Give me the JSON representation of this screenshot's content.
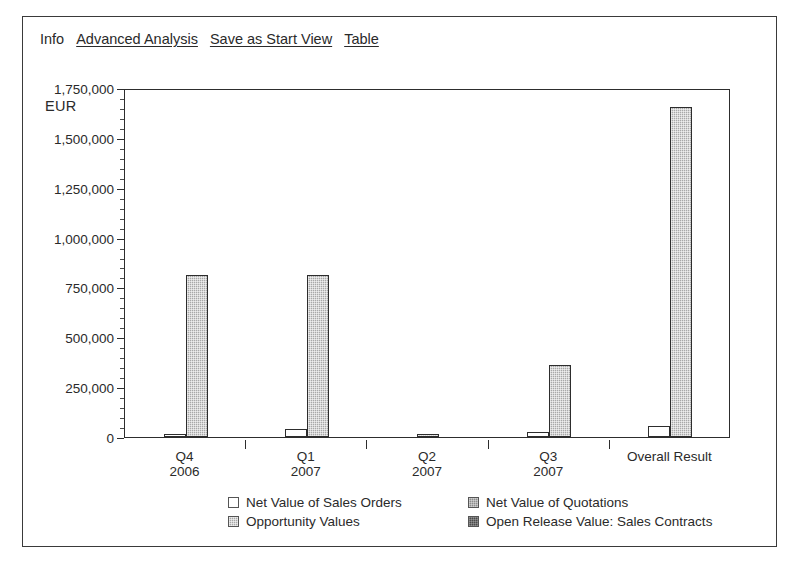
{
  "toolbar": {
    "items": [
      {
        "label": "Info",
        "link": false
      },
      {
        "label": "Advanced Analysis",
        "link": true
      },
      {
        "label": "Save as Start View",
        "link": true
      },
      {
        "label": "Table",
        "link": true
      }
    ]
  },
  "axis": {
    "unit_label": "EUR",
    "y_ticks": [
      "1,750,000",
      "1,500,000",
      "1,250,000",
      "1,000,000",
      "750,000",
      "500,000",
      "250,000",
      "0"
    ]
  },
  "colors": {
    "net_value_sales_orders": "#ffffff",
    "net_value_quotations": "#8d8d8d",
    "opportunity_values": "#a8a8a8",
    "open_release_value": "#4a4a4a",
    "axis": "#2d2d2d",
    "text": "#2a2a2a",
    "frame": "#3a3a3a"
  },
  "legend": {
    "entries": [
      {
        "label": "Net Value of Sales Orders",
        "swatch": "sw-white"
      },
      {
        "label": "Net Value of Quotations",
        "swatch": "sw-midgray"
      },
      {
        "label": "Opportunity Values",
        "swatch": "sw-lightgray"
      },
      {
        "label": "Open Release Value: Sales Contracts",
        "swatch": "sw-darkgray"
      }
    ]
  },
  "chart_data": {
    "type": "bar",
    "title": "",
    "subtitle": "",
    "xlabel": "",
    "ylabel": "EUR",
    "ylim": [
      0,
      1750000
    ],
    "ytick_step": 250000,
    "yticks": [
      0,
      250000,
      500000,
      750000,
      1000000,
      1250000,
      1500000,
      1750000
    ],
    "minor_ticks_per_interval": 5,
    "grid": false,
    "legend_position": "bottom",
    "categories": [
      "Q4\n2006",
      "Q1\n2007",
      "Q2\n2007",
      "Q3\n2007",
      "Overall Result"
    ],
    "category_lines": [
      [
        "Q4",
        "2006"
      ],
      [
        "Q1",
        "2007"
      ],
      [
        "Q2",
        "2007"
      ],
      [
        "Q3",
        "2007"
      ],
      [
        "Overall Result",
        ""
      ]
    ],
    "series": [
      {
        "name": "Net Value of Sales Orders",
        "color": "#ffffff",
        "style": "white",
        "values": [
          5000,
          40000,
          0,
          25000,
          55000
        ]
      },
      {
        "name": "Net Value of Quotations",
        "color": "#8d8d8d",
        "style": "midgray",
        "values": [
          0,
          0,
          0,
          0,
          0
        ]
      },
      {
        "name": "Opportunity Values",
        "color": "#a8a8a8",
        "style": "lightgray",
        "values": [
          810000,
          810000,
          8000,
          363000,
          1655000
        ]
      },
      {
        "name": "Open Release Value: Sales Contracts",
        "color": "#4a4a4a",
        "style": "darkgray",
        "values": [
          0,
          0,
          0,
          0,
          0
        ]
      }
    ]
  }
}
